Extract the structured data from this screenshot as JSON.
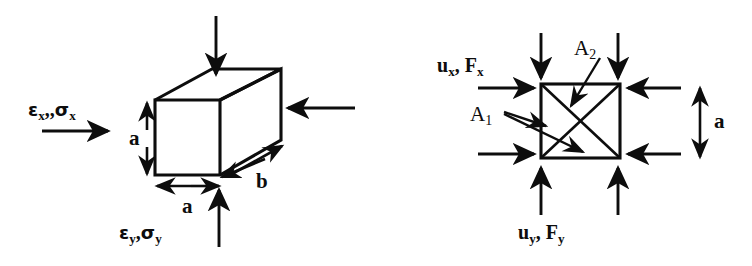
{
  "figure": {
    "stroke_color": "#0d0d0d",
    "background_color": "#ffffff"
  },
  "left_diagram": {
    "name": "3d-cube-stress-element",
    "labels": {
      "x_axis_load": {
        "base1": "ε",
        "sub1": "x",
        "sep": ",,",
        "base2": "σ",
        "sub2": "x"
      },
      "y_axis_load": {
        "base1": "ε",
        "sub1": "y",
        "sep": ",",
        "base2": "σ",
        "sub2": "y"
      },
      "height_dim": "a",
      "width_dim": "a",
      "depth_dim": "b"
    },
    "arrows": {
      "top_compression": "down-arrow",
      "bottom_compression": "up-arrow",
      "left_tension": "right-arrow",
      "right_compression": "left-arrow",
      "height_dimension": "double-headed-vertical-arrow",
      "width_dimension": "double-headed-horizontal-arrow",
      "depth_dimension": "double-headed-diagonal-arrow"
    }
  },
  "right_diagram": {
    "name": "square-element-with-diagonals",
    "labels": {
      "x_load": {
        "base1": "u",
        "sub1": "x",
        "sep": ", ",
        "base2": "F",
        "sub2": "x"
      },
      "y_load": {
        "base1": "u",
        "sub1": "y",
        "sep": ", ",
        "base2": "F",
        "sub2": "y"
      },
      "area_2": {
        "base": "A",
        "sub": "2"
      },
      "area_1": {
        "base": "A",
        "sub": "1"
      },
      "side_dim": "a"
    },
    "arrows": {
      "top_compression_left": "down-arrow",
      "top_compression_right": "down-arrow",
      "bottom_compression_left": "up-arrow",
      "bottom_compression_right": "up-arrow",
      "left_load_upper": "right-arrow",
      "left_load_lower": "right-arrow",
      "right_load_upper": "left-arrow",
      "right_load_lower": "left-arrow",
      "side_dimension": "double-headed-vertical-arrow",
      "a2_leader": "leader-arrow",
      "a1_leader": "double-leader-arrow"
    }
  }
}
